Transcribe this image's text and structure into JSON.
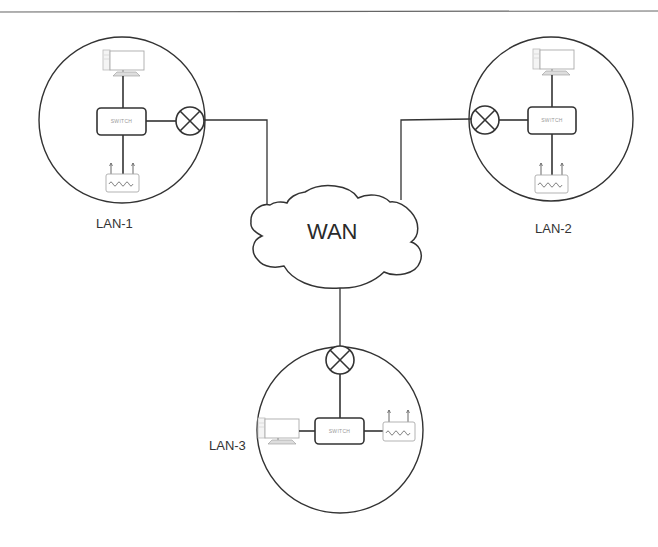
{
  "diagram": {
    "type": "network-topology",
    "wan": {
      "label": "WAN"
    },
    "lans": [
      {
        "id": "lan-1",
        "label": "LAN-1",
        "switch_label": "SWITCH",
        "devices": [
          "pc",
          "switch",
          "router",
          "gateway"
        ]
      },
      {
        "id": "lan-2",
        "label": "LAN-2",
        "switch_label": "SWITCH",
        "devices": [
          "pc",
          "switch",
          "router",
          "gateway"
        ]
      },
      {
        "id": "lan-3",
        "label": "LAN-3",
        "switch_label": "SWITCH",
        "devices": [
          "pc",
          "switch",
          "router",
          "gateway"
        ]
      }
    ],
    "connections": [
      {
        "from": "lan-1.gateway",
        "to": "wan"
      },
      {
        "from": "lan-2.gateway",
        "to": "wan"
      },
      {
        "from": "lan-3.gateway",
        "to": "wan"
      }
    ],
    "icons": {
      "gateway": "crossed-circle-icon",
      "pc": "desktop-computer-icon",
      "router": "wireless-router-icon",
      "switch": "network-switch-icon",
      "wan": "cloud-icon"
    },
    "colors": {
      "line": "#333333",
      "device_stroke": "#aaaaaa",
      "background": "#ffffff"
    }
  }
}
